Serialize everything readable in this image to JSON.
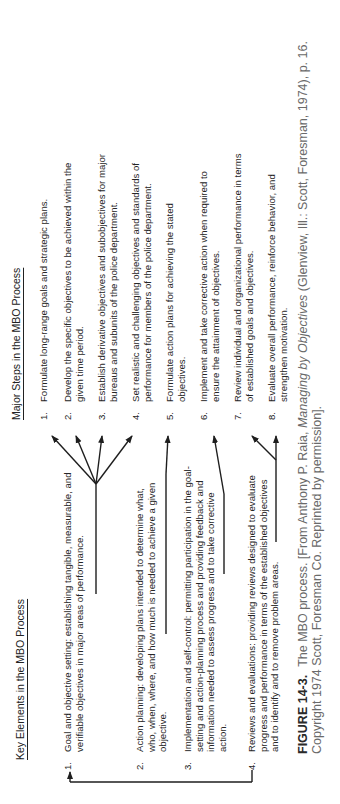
{
  "figure": {
    "key_elements": {
      "heading": "Key Elements in the MBO Process",
      "items": [
        {
          "number": "1.",
          "text": "Goal and objective setting:  establishing tangible, measurable, and verifiable objectives in major areas of performance."
        },
        {
          "number": "2.",
          "text": "Action planning:  developing plans intended to determine what, who, when, where, and how much is needed to achieve a given objective."
        },
        {
          "number": "3.",
          "text": "Implementation and self-control:  permitting participation in the goal-setting and action-planning process and providing feedback and information needed to assess progress and to take corrective action."
        },
        {
          "number": "4.",
          "text": "Reviews and evaluations:  providing reviews designed to evaluate progress and performance in terms of the established objectives and to identify and to remove problem areas."
        }
      ]
    },
    "major_steps": {
      "heading": "Major Steps in the MBO Process",
      "items": [
        {
          "number": "1.",
          "text": "Formulate long-range goals and strategic plans."
        },
        {
          "number": "2.",
          "text": "Develop the specific objectives to be achieved within the given time period."
        },
        {
          "number": "3.",
          "text": "Establish derivative objectives and subobjectives for major bureaus and subunits of the police department."
        },
        {
          "number": "4.",
          "text": "Set realistic and challenging objectives and standards of performance for members of the police department."
        },
        {
          "number": "5.",
          "text": "Formulate action plans for achieving the stated objectives."
        },
        {
          "number": "6.",
          "text": "Implement and take corrective action when required to ensure the attainment of objectives."
        },
        {
          "number": "7.",
          "text": "Review individual and organizational performance in terms of established goals and objectives."
        },
        {
          "number": "8.",
          "text": "Evaluate overall performance, reinforce behavior, and strengthen motivation."
        }
      ]
    },
    "mapping": [
      {
        "from": 1,
        "to": [
          1,
          2,
          3,
          4
        ]
      },
      {
        "from": 2,
        "to": [
          5
        ]
      },
      {
        "from": 3,
        "to": [
          6
        ]
      },
      {
        "from": 4,
        "to": [
          7,
          8
        ]
      },
      {
        "from": 4,
        "loop_to": 1
      }
    ],
    "caption": {
      "label": "FIGURE 14-3.",
      "text_before_title": "The MBO process. [From Anthony P. Raia, ",
      "book_title": "Managing by Objectives",
      "text_after_title": " (Glenview, Ill.: Scott, Foresman, 1974), p. 16. Copyright 1974 Scott, Foresman Co. Reprinted by permission]."
    },
    "orientation": "rotated 90 degrees counter-clockwise"
  }
}
